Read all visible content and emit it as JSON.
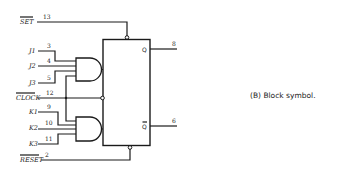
{
  "figure": {
    "caption": "(B) Block symbol.",
    "component": "JK flip-flop block symbol",
    "inputs": {
      "set": {
        "label": "SET",
        "pin": "13",
        "active_low": true
      },
      "j1": {
        "label": "J1",
        "pin": "3"
      },
      "j2": {
        "label": "J2",
        "pin": "4"
      },
      "j3": {
        "label": "J3",
        "pin": "5"
      },
      "clock": {
        "label": "CLOCK",
        "pin": "12",
        "active_low": true
      },
      "k1": {
        "label": "K1",
        "pin": "9"
      },
      "k2": {
        "label": "K2",
        "pin": "10"
      },
      "k3": {
        "label": "K3",
        "pin": "11"
      },
      "reset": {
        "label": "RESET",
        "pin": "2",
        "active_low": true
      }
    },
    "outputs": {
      "q": {
        "label": "Q",
        "pin": "8"
      },
      "q_bar": {
        "label": "Q̄",
        "pin": "6"
      }
    },
    "gates": [
      {
        "type": "AND",
        "inputs": [
          "J1",
          "J2",
          "J3"
        ]
      },
      {
        "type": "AND",
        "inputs": [
          "K1",
          "K2",
          "K3"
        ]
      }
    ]
  }
}
